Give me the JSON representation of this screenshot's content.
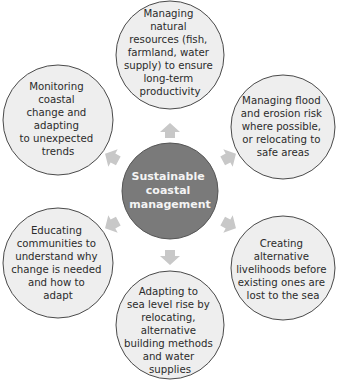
{
  "colors": {
    "outer_fill": "#eeeeee",
    "outer_stroke": "#4a4a4a",
    "center_fill": "#7a7a7a",
    "center_stroke": "#555555",
    "arrow": "#c8c8c8",
    "center_text": "#f4f4f4",
    "text": "#2b2b2b"
  },
  "center": {
    "lines": [
      "Sustainable",
      "coastal",
      "management"
    ]
  },
  "nodes": [
    {
      "id": "top",
      "lines": [
        "Managing",
        "natural",
        "resources (fish,",
        "farmland, water",
        "supply) to ensure",
        "long-term",
        "productivity"
      ]
    },
    {
      "id": "top-right",
      "lines": [
        "Managing flood",
        "and erosion risk",
        "where possible,",
        "or relocating to",
        "safe areas"
      ]
    },
    {
      "id": "bottom-right",
      "lines": [
        "Creating",
        "alternative",
        "livelihoods before",
        "existing ones are",
        "lost to the sea"
      ]
    },
    {
      "id": "bottom",
      "lines": [
        "Adapting to",
        "sea level rise by",
        "relocating,",
        "alternative",
        "building methods",
        "and water",
        "supplies"
      ]
    },
    {
      "id": "bottom-left",
      "lines": [
        "Educating",
        "communities to",
        "understand why",
        "change is needed",
        "and how to",
        "adapt"
      ]
    },
    {
      "id": "top-left",
      "lines": [
        "Monitoring",
        "coastal",
        "change and",
        "adapting",
        "to unexpected",
        "trends"
      ]
    }
  ]
}
